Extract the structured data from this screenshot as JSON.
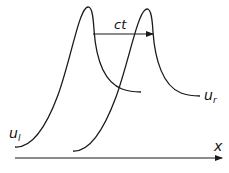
{
  "diagram": {
    "type": "traveling-wave",
    "labels": {
      "shift": "ct",
      "left_state_base": "u",
      "left_state_sub": "l",
      "right_state_base": "u",
      "right_state_sub": "r",
      "axis": "x"
    },
    "colors": {
      "stroke": "#1a1a1a",
      "background": "#ffffff"
    }
  }
}
